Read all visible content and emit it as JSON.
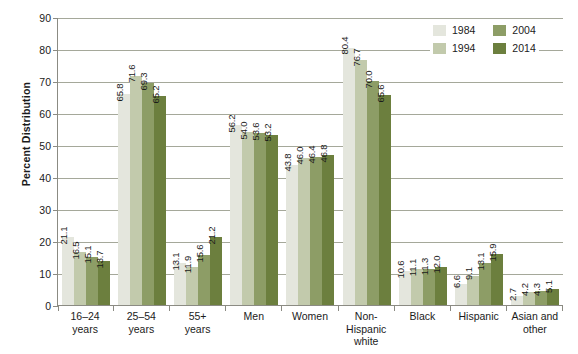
{
  "chart_data": {
    "type": "bar",
    "title": "",
    "xlabel": "",
    "ylabel": "Percent Distribution",
    "ylim": [
      0,
      90
    ],
    "yticks": [
      0,
      10,
      20,
      30,
      40,
      50,
      60,
      70,
      80,
      90
    ],
    "grid": true,
    "legend_position": "top-right",
    "categories": [
      "16–24\nyears",
      "25–54\nyears",
      "55+\nyears",
      "Men",
      "Women",
      "Non-\nHispanic\nwhite",
      "Black",
      "Hispanic",
      "Asian and\nother"
    ],
    "series": [
      {
        "name": "1984",
        "color": "#e4e6dd",
        "values": [
          21.1,
          65.8,
          13.1,
          56.2,
          43.8,
          80.4,
          10.6,
          6.6,
          2.7
        ]
      },
      {
        "name": "1994",
        "color": "#c2caac",
        "values": [
          16.5,
          71.6,
          11.9,
          54.0,
          46.0,
          76.7,
          11.1,
          9.1,
          4.2
        ]
      },
      {
        "name": "2004",
        "color": "#8d9d66",
        "values": [
          15.1,
          69.3,
          15.6,
          53.6,
          46.4,
          70.0,
          11.3,
          13.1,
          4.3
        ]
      },
      {
        "name": "2014",
        "color": "#6c7f3e",
        "values": [
          13.7,
          65.2,
          21.2,
          53.2,
          46.8,
          65.6,
          12.0,
          15.9,
          5.1
        ]
      }
    ],
    "value_labels": [
      [
        "21.1",
        "16.5",
        "15.1",
        "13.7"
      ],
      [
        "65.8",
        "71.6",
        "69.3",
        "65.2"
      ],
      [
        "13.1",
        "11.9",
        "15.6",
        "21.2"
      ],
      [
        "56.2",
        "54.0",
        "53.6",
        "53.2"
      ],
      [
        "43.8",
        "46.0",
        "46.4",
        "46.8"
      ],
      [
        "80.4",
        "76.7",
        "70.0",
        "65.6"
      ],
      [
        "10.6",
        "11.1",
        "11.3",
        "12.0"
      ],
      [
        "6.6",
        "9.1",
        "13.1",
        "15.9"
      ],
      [
        "2.7",
        "4.2",
        "4.3",
        "5.1"
      ]
    ],
    "ytick_labels": [
      "0",
      "10",
      "20",
      "30",
      "40",
      "50",
      "60",
      "70",
      "80",
      "90"
    ],
    "xtick_labels": [
      [
        "16–24",
        "years"
      ],
      [
        "25–54",
        "years"
      ],
      [
        "55+",
        "years"
      ],
      [
        "Men"
      ],
      [
        "Women"
      ],
      [
        "Non-",
        "Hispanic",
        "white"
      ],
      [
        "Black"
      ],
      [
        "Hispanic"
      ],
      [
        "Asian and",
        "other"
      ]
    ],
    "legend_labels": [
      "1984",
      "1994",
      "2004",
      "2014"
    ],
    "legend_colors": [
      "#e4e6dd",
      "#c2caac",
      "#8d9d66",
      "#6c7f3e"
    ]
  }
}
